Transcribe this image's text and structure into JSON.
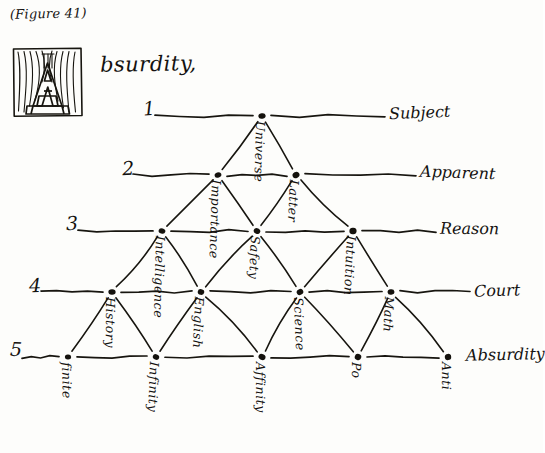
{
  "figure": {
    "caption": "(Figure 41)",
    "dropcap_letter": "A",
    "headline_rest": "bsurdity,"
  },
  "ink_color": "#17150f",
  "paper_color": "#fdfdfb",
  "rows": [
    {
      "number": "1",
      "right_label": "Subject",
      "y": 116,
      "node_count": 1
    },
    {
      "number": "2",
      "right_label": "Apparent",
      "y": 175,
      "node_count": 2
    },
    {
      "number": "3",
      "right_label": "Reason",
      "y": 231,
      "node_count": 3
    },
    {
      "number": "4",
      "right_label": "Court",
      "y": 292,
      "node_count": 4
    },
    {
      "number": "5",
      "right_label": "Absurdity",
      "y": 357,
      "node_count": 5
    }
  ],
  "nodes": [
    {
      "id": "n1",
      "row": 1,
      "label": "Universe",
      "x": 262,
      "y": 116
    },
    {
      "id": "n2a",
      "row": 2,
      "label": "Importance",
      "x": 218,
      "y": 175
    },
    {
      "id": "n2b",
      "row": 2,
      "label": "Latter",
      "x": 296,
      "y": 175
    },
    {
      "id": "n3a",
      "row": 3,
      "label": "Intelligence",
      "x": 162,
      "y": 231
    },
    {
      "id": "n3b",
      "row": 3,
      "label": "Safety",
      "x": 257,
      "y": 231
    },
    {
      "id": "n3c",
      "row": 3,
      "label": "Intuition",
      "x": 353,
      "y": 231
    },
    {
      "id": "n4a",
      "row": 4,
      "label": "History",
      "x": 112,
      "y": 292
    },
    {
      "id": "n4b",
      "row": 4,
      "label": "English",
      "x": 201,
      "y": 292
    },
    {
      "id": "n4c",
      "row": 4,
      "label": "Science",
      "x": 300,
      "y": 292
    },
    {
      "id": "n4d",
      "row": 4,
      "label": "Math",
      "x": 391,
      "y": 292
    },
    {
      "id": "n5a",
      "row": 5,
      "label": "finite",
      "x": 68,
      "y": 357
    },
    {
      "id": "n5b",
      "row": 5,
      "label": "Infinity",
      "x": 156,
      "y": 357
    },
    {
      "id": "n5c",
      "row": 5,
      "label": "Affinity",
      "x": 262,
      "y": 357
    },
    {
      "id": "n5d",
      "row": 5,
      "label": "Po",
      "x": 358,
      "y": 357
    },
    {
      "id": "n5e",
      "row": 5,
      "label": "Anti",
      "x": 448,
      "y": 357
    }
  ],
  "edges": [
    [
      "n1",
      "n2a"
    ],
    [
      "n1",
      "n2b"
    ],
    [
      "n2a",
      "n3a"
    ],
    [
      "n2a",
      "n3b"
    ],
    [
      "n2b",
      "n3b"
    ],
    [
      "n2b",
      "n3c"
    ],
    [
      "n3a",
      "n4a"
    ],
    [
      "n3a",
      "n4b"
    ],
    [
      "n3b",
      "n4b"
    ],
    [
      "n3b",
      "n4c"
    ],
    [
      "n3c",
      "n4c"
    ],
    [
      "n3c",
      "n4d"
    ],
    [
      "n4a",
      "n5a"
    ],
    [
      "n4a",
      "n5b"
    ],
    [
      "n4b",
      "n5b"
    ],
    [
      "n4b",
      "n5c"
    ],
    [
      "n4c",
      "n5c"
    ],
    [
      "n4c",
      "n5d"
    ],
    [
      "n4d",
      "n5d"
    ],
    [
      "n4d",
      "n5e"
    ]
  ],
  "row_number_positions": [
    {
      "x": 143,
      "y": 97
    },
    {
      "x": 122,
      "y": 157
    },
    {
      "x": 66,
      "y": 212
    },
    {
      "x": 29,
      "y": 274
    },
    {
      "x": 10,
      "y": 338
    }
  ],
  "row_label_positions": [
    {
      "x": 389,
      "y": 103
    },
    {
      "x": 420,
      "y": 163
    },
    {
      "x": 440,
      "y": 219
    },
    {
      "x": 474,
      "y": 281
    },
    {
      "x": 466,
      "y": 345
    }
  ],
  "row_line_spans": [
    {
      "x1": 155,
      "x2": 385
    },
    {
      "x1": 133,
      "x2": 416
    },
    {
      "x1": 78,
      "x2": 436
    },
    {
      "x1": 41,
      "x2": 470
    },
    {
      "x1": 22,
      "x2": 462
    }
  ]
}
